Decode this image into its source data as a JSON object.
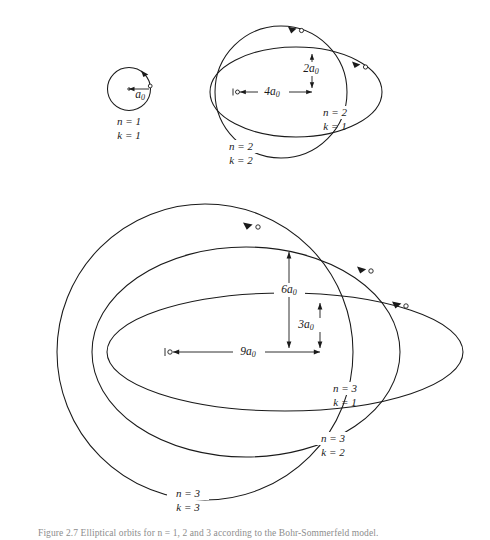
{
  "figure": {
    "background_color": "#ffffff",
    "stroke_color": "#1a1a1a",
    "caption_partial": "Figure 2.7  Elliptical orbits for n = 1, 2 and 3 according to the Bohr-Sommerfeld model."
  },
  "shells": [
    {
      "id": "n1",
      "n_label": "n = 1",
      "k_label": "k = 1",
      "orbit_type": "circle"
    },
    {
      "id": "n2k2",
      "n_label": "n = 2",
      "k_label": "k = 2",
      "orbit_type": "circle"
    },
    {
      "id": "n2k1",
      "n_label": "n = 2",
      "k_label": "k = 1",
      "orbit_type": "ellipse"
    },
    {
      "id": "n3k3",
      "n_label": "n = 3",
      "k_label": "k = 3",
      "orbit_type": "circle"
    },
    {
      "id": "n3k2",
      "n_label": "n = 3",
      "k_label": "k = 2",
      "orbit_type": "ellipse"
    },
    {
      "id": "n3k1",
      "n_label": "n = 3",
      "k_label": "k = 1",
      "orbit_type": "ellipse"
    }
  ],
  "dimensions": [
    {
      "id": "a0",
      "coefficient": "",
      "symbol": "a",
      "subscript": "0",
      "orientation": "horizontal",
      "group": "n1"
    },
    {
      "id": "4a0",
      "coefficient": "4",
      "symbol": "a",
      "subscript": "0",
      "orientation": "horizontal",
      "group": "n2"
    },
    {
      "id": "2a0",
      "coefficient": "2",
      "symbol": "a",
      "subscript": "0",
      "orientation": "vertical",
      "group": "n2"
    },
    {
      "id": "9a0",
      "coefficient": "9",
      "symbol": "a",
      "subscript": "0",
      "orientation": "horizontal",
      "group": "n3"
    },
    {
      "id": "6a0",
      "coefficient": "6",
      "symbol": "a",
      "subscript": "0",
      "orientation": "vertical",
      "group": "n3"
    },
    {
      "id": "3a0",
      "coefficient": "3",
      "symbol": "a",
      "subscript": "0",
      "orientation": "vertical",
      "group": "n3"
    }
  ],
  "labels": {
    "a0": "a",
    "a0_sub": "0",
    "two_a0": "2a",
    "four_a0": "4a",
    "three_a0": "3a",
    "six_a0": "6a",
    "nine_a0": "9a",
    "sub_zero": "0",
    "n1": "n = 1",
    "k1": "k = 1",
    "n2_a": "n = 2",
    "k2_a": "k = 2",
    "n2_b": "n = 2",
    "k1_b": "k = 1",
    "n3_a": "n = 3",
    "k1_c": "k = 1",
    "n3_b": "n = 3",
    "k2_c": "k = 2",
    "n3_c": "n = 3",
    "k3_c": "k = 3"
  },
  "markers": {
    "nucleus_name": "nucleus-focus-marker",
    "electron_name": "electron-marker",
    "arrow_name": "direction-arrowhead"
  }
}
